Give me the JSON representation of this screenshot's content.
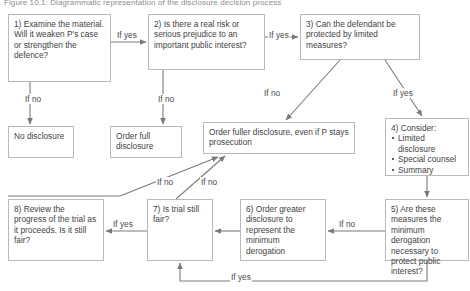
{
  "figure": {
    "title": "Figure 10.1: Diagrammatic representation of the disclosure decision process",
    "accent_color": "#7a7a7a",
    "box_border_color": "#b9b9b9",
    "text_color": "#3f3f3f"
  },
  "nodes": {
    "n1": {
      "text": "1) Examine the material. Will it weaken P's case or strengthen the defence?"
    },
    "n2": {
      "text": "2) Is there a real risk or serious prejudice to an important public interest?"
    },
    "n3": {
      "text": "3) Can the defendant be protected by limited measures?"
    },
    "n4": {
      "title": "4) Consider:",
      "bullets": [
        "Limited disclosure",
        "Special counsel",
        "Summary"
      ]
    },
    "n5": {
      "text": "5) Are these measures the minimum derogation necessary to protect public interest?"
    },
    "n6": {
      "text": "6) Order greater disclosure to represent the minimum derogation"
    },
    "n7": {
      "text": "7) Is trial still fair?"
    },
    "n8": {
      "text": "8) Review the progress of the trial as it proceeds. Is it still fair?"
    },
    "n_no_disclosure": {
      "text": "No disclosure"
    },
    "n_full_disclosure": {
      "text": "Order full disclosure"
    },
    "n_fuller_disclosure": {
      "text": "Order fuller disclosure, even if P stays prosecution"
    }
  },
  "edge_labels": {
    "n1_to_n2": "If yes",
    "n1_to_no_disclosure": "If no",
    "n2_to_n3": "If yes",
    "n2_to_full_disclosure": "If no",
    "n3_to_fuller_disclosure": "If no",
    "n3_to_n4": "If yes",
    "n5_to_n6": "If no",
    "n5_to_n7": "If yes",
    "n7_to_n8": "If yes",
    "n7_to_fuller_disclosure": "If no",
    "n8_to_fuller_disclosure": "If no"
  }
}
